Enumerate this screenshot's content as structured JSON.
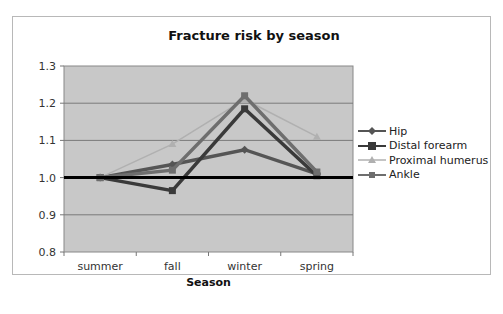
{
  "chart_data": {
    "type": "line",
    "title": "Fracture risk by season",
    "xlabel": "Season",
    "ylabel": "",
    "categories": [
      "summer",
      "fall",
      "winter",
      "spring"
    ],
    "ylim": [
      0.8,
      1.3
    ],
    "yticks": [
      "0.8",
      "0.9",
      "1.0",
      "1.1",
      "1.2",
      "1.3"
    ],
    "grid": true,
    "reference_line": 1.0,
    "legend_position": "right",
    "series": [
      {
        "name": "Hip",
        "values": [
          1.0,
          1.035,
          1.075,
          1.01
        ],
        "color": "#555555",
        "marker": "diamond"
      },
      {
        "name": "Distal forearm",
        "values": [
          1.0,
          0.965,
          1.185,
          1.005
        ],
        "color": "#3a3a3a",
        "marker": "square"
      },
      {
        "name": "Proximal humerus",
        "values": [
          1.0,
          1.09,
          1.21,
          1.11
        ],
        "color": "#b0b0b0",
        "marker": "triangle"
      },
      {
        "name": "Ankle",
        "values": [
          1.0,
          1.02,
          1.22,
          1.015
        ],
        "color": "#6e6e6e",
        "marker": "square"
      }
    ]
  },
  "labels": {
    "title": "Fracture risk by season",
    "xlabel": "Season"
  }
}
